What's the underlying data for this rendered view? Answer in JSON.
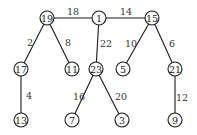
{
  "diagram": {
    "type": "weighted-tree",
    "nodes": [
      {
        "id": "19",
        "label": "19",
        "x": 47,
        "y": 18
      },
      {
        "id": "1",
        "label": "1",
        "x": 99,
        "y": 18
      },
      {
        "id": "15",
        "label": "15",
        "x": 152,
        "y": 18
      },
      {
        "id": "17",
        "label": "17",
        "x": 21,
        "y": 69
      },
      {
        "id": "11",
        "label": "11",
        "x": 72,
        "y": 69
      },
      {
        "id": "23",
        "label": "23",
        "x": 96,
        "y": 69
      },
      {
        "id": "5",
        "label": "5",
        "x": 123,
        "y": 69
      },
      {
        "id": "21",
        "label": "21",
        "x": 175,
        "y": 69
      },
      {
        "id": "13",
        "label": "13",
        "x": 21,
        "y": 120
      },
      {
        "id": "7",
        "label": "7",
        "x": 72,
        "y": 120
      },
      {
        "id": "3",
        "label": "3",
        "x": 122,
        "y": 120
      },
      {
        "id": "9",
        "label": "9",
        "x": 175,
        "y": 120
      }
    ],
    "edges": [
      {
        "from": "19",
        "to": "1",
        "weight": "18",
        "lx": 73,
        "ly": 11
      },
      {
        "from": "1",
        "to": "15",
        "weight": "14",
        "lx": 126,
        "ly": 11
      },
      {
        "from": "19",
        "to": "17",
        "weight": "2",
        "lx": 30,
        "ly": 42
      },
      {
        "from": "19",
        "to": "11",
        "weight": "8",
        "lx": 68,
        "ly": 42
      },
      {
        "from": "1",
        "to": "23",
        "weight": "22",
        "lx": 106,
        "ly": 43
      },
      {
        "from": "15",
        "to": "5",
        "weight": "10",
        "lx": 131,
        "ly": 43
      },
      {
        "from": "15",
        "to": "21",
        "weight": "6",
        "lx": 172,
        "ly": 43
      },
      {
        "from": "17",
        "to": "13",
        "weight": "4",
        "lx": 29,
        "ly": 95
      },
      {
        "from": "23",
        "to": "7",
        "weight": "16",
        "lx": 79,
        "ly": 96
      },
      {
        "from": "23",
        "to": "3",
        "weight": "20",
        "lx": 121,
        "ly": 96
      },
      {
        "from": "21",
        "to": "9",
        "weight": "12",
        "lx": 182,
        "ly": 97
      }
    ],
    "node_radius": 7,
    "colors": {
      "stroke": "#1a1a1a",
      "fill": "#ffffff",
      "text": "#1a1a1a"
    }
  }
}
